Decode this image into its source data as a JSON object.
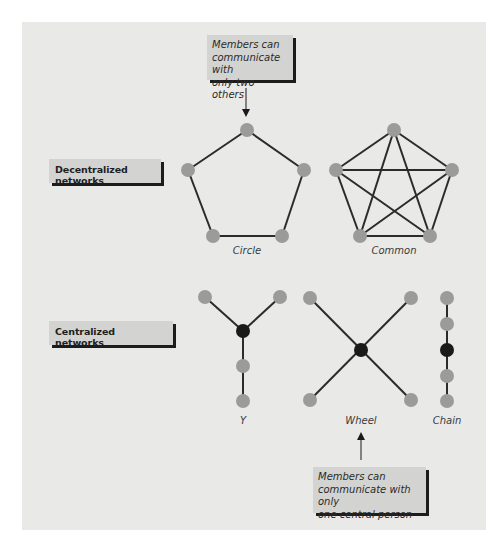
{
  "callouts": {
    "top": {
      "lines": [
        "Members can",
        "communicate with",
        "only two others"
      ]
    },
    "bottom": {
      "lines": [
        "Members can",
        "communicate with only",
        "one central person"
      ]
    }
  },
  "categories": {
    "decentralized": "Decentralized networks",
    "centralized": "Centralized networks"
  },
  "networks": [
    {
      "id": "circle",
      "label": "Circle",
      "group": "decentralized"
    },
    {
      "id": "common",
      "label": "Common",
      "group": "decentralized"
    },
    {
      "id": "y",
      "label": "Y",
      "group": "centralized"
    },
    {
      "id": "wheel",
      "label": "Wheel",
      "group": "centralized"
    },
    {
      "id": "chain",
      "label": "Chain",
      "group": "centralized"
    }
  ],
  "colors": {
    "background": "#e9e9e8",
    "node": "#9b9b9a",
    "central_node": "#1a1a1a",
    "edge": "#2b2b2b",
    "label_box": "#d3d3d1",
    "shadow": "#1c1c1c"
  }
}
